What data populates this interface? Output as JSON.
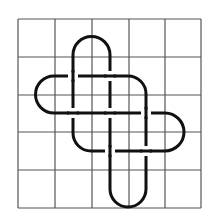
{
  "diagram": {
    "type": "knot-on-grid",
    "grid": {
      "columns": 5,
      "rows": 5,
      "x_lines": [
        18,
        55,
        92,
        129,
        165,
        201
      ],
      "y_lines": [
        19,
        57,
        95,
        132,
        170,
        208
      ],
      "color": "#555555",
      "stroke_width": 1.2
    },
    "knot": {
      "color": "#111111",
      "stroke_width": 3,
      "strands": [
        "M 73 113 L 73 55 A 18.5 18.5 0 0 1 110 55 L 110 189",
        "M 110 189 A 18 18 0 0 0 146 189 L 146 94 A 18 18 0 0 0 128 76 L 54 76 A 18.5 18.5 0 0 0 54 113 L 165 113 A 19 19 0 0 1 165 151 L 91 151 A 18 18 0 0 1 73 133 L 73 113"
      ],
      "under_crossings": [
        {
          "x": 73,
          "y": 76,
          "orientation": "horizontal-under"
        },
        {
          "x": 110,
          "y": 76,
          "orientation": "vertical-under"
        },
        {
          "x": 73,
          "y": 113,
          "orientation": "vertical-under"
        },
        {
          "x": 110,
          "y": 113,
          "orientation": "vertical-under"
        },
        {
          "x": 146,
          "y": 113,
          "orientation": "horizontal-under"
        },
        {
          "x": 110,
          "y": 151,
          "orientation": "horizontal-under"
        },
        {
          "x": 146,
          "y": 151,
          "orientation": "vertical-under"
        }
      ]
    }
  }
}
